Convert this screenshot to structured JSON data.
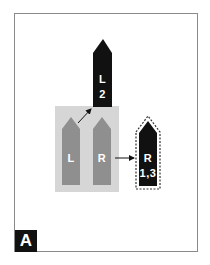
{
  "diagram": {
    "panel_label": "A",
    "colors": {
      "frame": "#8a8a8a",
      "group_background": "#d6d6d6",
      "gray_arrow": "#8f8f8f",
      "black_arrow": "#111111",
      "text": "#ffffff"
    },
    "source_group": {
      "arrows": [
        {
          "id": "left",
          "label": "L"
        },
        {
          "id": "right",
          "label": "R"
        }
      ]
    },
    "targets": [
      {
        "id": "top",
        "line1": "L",
        "line2": "2",
        "from": "left",
        "dashed_outline": false
      },
      {
        "id": "right",
        "line1": "R",
        "line2": "1,3",
        "from": "right",
        "dashed_outline": true
      }
    ]
  }
}
